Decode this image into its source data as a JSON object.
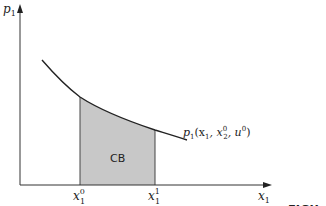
{
  "diagram": {
    "y_axis_label": "p",
    "y_axis_sub": "1",
    "x_axis_label": "x",
    "x_axis_sub": "1",
    "shaded_area_label": "CB",
    "curve_label": {
      "text": "p",
      "sub": "1",
      "args": "(x",
      "args_sub1": "1",
      "mid": ", x",
      "sup2": "0",
      "sub2": "2",
      "tail": ", u",
      "sup3": "0",
      "close": ")"
    },
    "x_ticks": [
      {
        "base": "x",
        "sup": "0",
        "sub": "1"
      },
      {
        "base": "x",
        "sup": "1",
        "sub": "1"
      }
    ],
    "fill_color": "#c8c8c8",
    "line_color": "#222222"
  },
  "caption": {
    "line1": "FIGU",
    "line2": "satec"
  }
}
